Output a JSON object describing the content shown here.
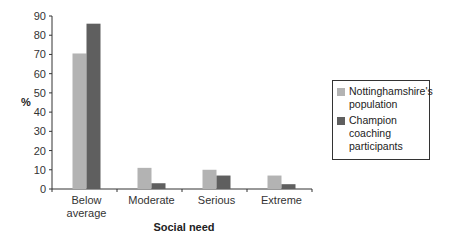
{
  "chart_data": {
    "type": "bar",
    "title": "",
    "xlabel": "Social need",
    "ylabel": "%",
    "ylim": [
      0,
      90
    ],
    "yticks": [
      0,
      10,
      20,
      30,
      40,
      50,
      60,
      70,
      80,
      90
    ],
    "grid": false,
    "legend_position": "right",
    "categories": [
      "Below average",
      "Moderate",
      "Serious",
      "Extreme"
    ],
    "category_lines": [
      [
        "Below",
        "average"
      ],
      [
        "Moderate"
      ],
      [
        "Serious"
      ],
      [
        "Extreme"
      ]
    ],
    "series": [
      {
        "name": "Nottinghamshire's population",
        "color": "#b3b3b3",
        "values": [
          70.5,
          11,
          10,
          7
        ]
      },
      {
        "name": "Champion coaching participants",
        "color": "#5f5f5f",
        "values": [
          86,
          3,
          7,
          2.5
        ]
      }
    ]
  },
  "legend": {
    "items": [
      {
        "line1": "Nottinghamshire's",
        "line2": "population",
        "color": "#b3b3b3"
      },
      {
        "line1": "Champion coaching",
        "line2": "participants",
        "color": "#5f5f5f"
      }
    ]
  }
}
